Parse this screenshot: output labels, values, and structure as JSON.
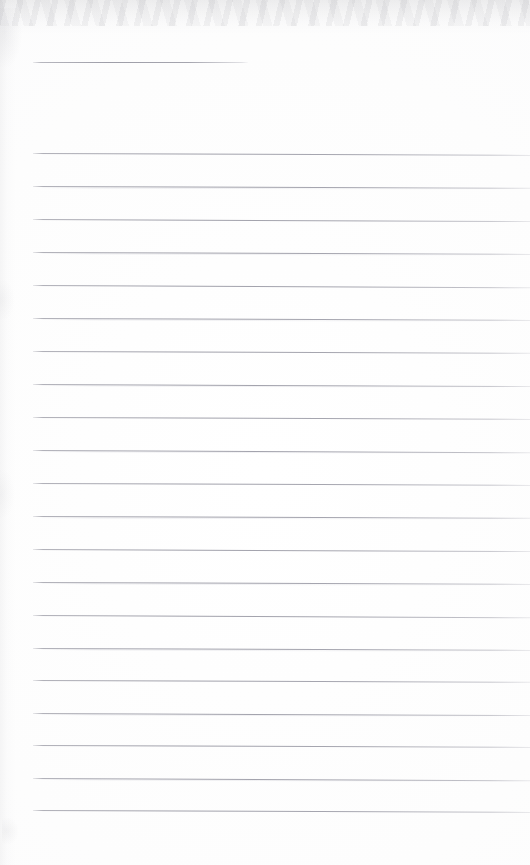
{
  "document": {
    "kind": "scanned-ruled-notebook-page",
    "title": "Blank ruled notebook page",
    "page_width": 530,
    "page_height": 865,
    "paper_color": "#fdfdfd",
    "rule_color": "#a0a0aa",
    "written_content": "",
    "header_text": ""
  },
  "ruling": {
    "left_margin_x": 33,
    "right_edge_x": 530,
    "line_spacing": 32.85,
    "line_thickness": 1,
    "skew_degrees": 0.22,
    "full_line_count": 21,
    "short_line_count": 1
  },
  "header_rule": {
    "label": "header-rule",
    "x": 33,
    "y": 62,
    "width": 215
  },
  "rules": [
    {
      "label": "rule-1",
      "x": 33,
      "y": 153,
      "width": 497,
      "skew": 0.22
    },
    {
      "label": "rule-2",
      "x": 33,
      "y": 186,
      "width": 497,
      "skew": 0.2
    },
    {
      "label": "rule-3",
      "x": 33,
      "y": 219,
      "width": 497,
      "skew": 0.24
    },
    {
      "label": "rule-4",
      "x": 33,
      "y": 252,
      "width": 497,
      "skew": 0.22
    },
    {
      "label": "rule-5",
      "x": 33,
      "y": 285,
      "width": 497,
      "skew": 0.26
    },
    {
      "label": "rule-6",
      "x": 33,
      "y": 318,
      "width": 497,
      "skew": 0.22
    },
    {
      "label": "rule-7",
      "x": 33,
      "y": 351,
      "width": 497,
      "skew": 0.2
    },
    {
      "label": "rule-8",
      "x": 33,
      "y": 384,
      "width": 497,
      "skew": 0.24
    },
    {
      "label": "rule-9",
      "x": 33,
      "y": 417,
      "width": 497,
      "skew": 0.22
    },
    {
      "label": "rule-10",
      "x": 33,
      "y": 450,
      "width": 497,
      "skew": 0.26
    },
    {
      "label": "rule-11",
      "x": 33,
      "y": 483,
      "width": 497,
      "skew": 0.22
    },
    {
      "label": "rule-12",
      "x": 33,
      "y": 516,
      "width": 497,
      "skew": 0.2
    },
    {
      "label": "rule-13",
      "x": 33,
      "y": 549,
      "width": 497,
      "skew": 0.24
    },
    {
      "label": "rule-14",
      "x": 33,
      "y": 582,
      "width": 497,
      "skew": 0.22
    },
    {
      "label": "rule-15",
      "x": 33,
      "y": 615,
      "width": 497,
      "skew": 0.26
    },
    {
      "label": "rule-16",
      "x": 33,
      "y": 648,
      "width": 497,
      "skew": 0.22
    },
    {
      "label": "rule-17",
      "x": 33,
      "y": 680,
      "width": 497,
      "skew": 0.2
    },
    {
      "label": "rule-18",
      "x": 33,
      "y": 713,
      "width": 497,
      "skew": 0.24
    },
    {
      "label": "rule-19",
      "x": 33,
      "y": 745,
      "width": 497,
      "skew": 0.22
    },
    {
      "label": "rule-20",
      "x": 33,
      "y": 778,
      "width": 497,
      "skew": 0.26
    },
    {
      "label": "rule-21",
      "x": 33,
      "y": 810,
      "width": 497,
      "skew": 0.22
    }
  ]
}
